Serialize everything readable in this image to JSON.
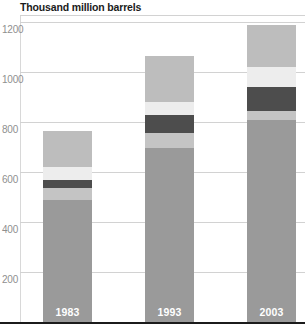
{
  "chart_data": {
    "type": "bar",
    "subtype": "stacked-bar",
    "title": "Thousand million barrels",
    "xlabel": "",
    "ylabel": "Thousand million barrels",
    "ylim": [
      0,
      1200
    ],
    "ytick_interval": 200,
    "yticks": [
      200,
      400,
      600,
      800,
      1000,
      1200
    ],
    "ytick_labels": [
      "200",
      "400",
      "600",
      "800",
      "1000",
      "1200"
    ],
    "grid": true,
    "legend": "none",
    "categories": [
      "1983",
      "1993",
      "2003"
    ],
    "series": [
      {
        "name": "segment-1-base",
        "color": "#9a9a9a",
        "values": [
          490,
          695,
          810
        ]
      },
      {
        "name": "segment-2",
        "color": "#c4c4c4",
        "values": [
          45,
          60,
          35
        ]
      },
      {
        "name": "segment-3-dark",
        "color": "#4d4d4d",
        "values": [
          35,
          75,
          95
        ]
      },
      {
        "name": "segment-4-light",
        "color": "#ededed",
        "values": [
          50,
          50,
          80
        ]
      },
      {
        "name": "segment-5-top",
        "color": "#bdbdbd",
        "values": [
          145,
          185,
          170
        ]
      }
    ],
    "totals": [
      765,
      1065,
      1190
    ]
  },
  "axis": {
    "ticks": [
      {
        "label": "1200",
        "value": 1200
      },
      {
        "label": "1000",
        "value": 1000
      },
      {
        "label": "800",
        "value": 800
      },
      {
        "label": "600",
        "value": 600
      },
      {
        "label": "400",
        "value": 400
      },
      {
        "label": "200",
        "value": 200
      }
    ]
  },
  "bars": [
    {
      "year": "1983",
      "total": 765
    },
    {
      "year": "1993",
      "total": 1065
    },
    {
      "year": "2003",
      "total": 1190
    }
  ],
  "colors": {
    "base": "#9a9a9a",
    "second": "#c4c4c4",
    "dark": "#4d4d4d",
    "light": "#ededed",
    "top": "#bdbdbd",
    "gridline": "#d2d2d2",
    "tick_text": "#8f8f8f",
    "title_text": "#1b1b1b",
    "baseline": "#1b1b1b",
    "year_text": "#ffffff",
    "background": "#ffffff"
  }
}
